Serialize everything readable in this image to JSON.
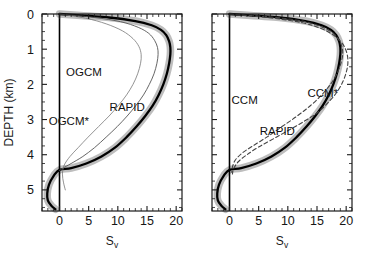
{
  "figure": {
    "background": "#ffffff",
    "panels": [
      {
        "id": "left",
        "xlabel": "S",
        "xlabel_sub": "v",
        "ylabel": "DEPTH (km)",
        "xticks": [
          0,
          5,
          10,
          15,
          20
        ],
        "yticks": [
          0,
          1,
          2,
          3,
          4,
          5
        ],
        "annotations": [
          {
            "text": "OGCM",
            "x": 4.2,
            "y": 1.75
          },
          {
            "text": "OGCM*",
            "x": 1.6,
            "y": 3.15
          },
          {
            "text": "RAPID",
            "x": 11.6,
            "y": 2.75
          }
        ]
      },
      {
        "id": "right",
        "xlabel": "S",
        "xlabel_sub": "v",
        "ylabel": "",
        "xticks": [
          0,
          5,
          10,
          15,
          20
        ],
        "yticks": [
          0,
          1,
          2,
          3,
          4,
          5
        ],
        "annotations": [
          {
            "text": "CCM",
            "x": 2.6,
            "y": 2.55
          },
          {
            "text": "CCM*",
            "x": 16.0,
            "y": 2.35
          },
          {
            "text": "RAPID",
            "x": 8.2,
            "y": 3.45
          }
        ]
      }
    ]
  },
  "chart_data": {
    "type": "line",
    "title": "",
    "xlabel": "Sv",
    "ylabel": "DEPTH (km)",
    "xlim": [
      -3,
      21
    ],
    "ylim": [
      0,
      5.6
    ],
    "y_inverted": true,
    "grid": false,
    "legend": "inline-annotations",
    "xticks": [
      0,
      5,
      10,
      15,
      20
    ],
    "yticks": [
      0,
      1,
      2,
      3,
      4,
      5
    ],
    "minor_tick_step_x": 1,
    "minor_tick_step_y": 0.25,
    "colors": {
      "rapid_line": "#000000",
      "rapid_band": "#b3b3b3",
      "ogcm": "#555555",
      "ccm": "#444444",
      "zero_line": "#000000",
      "frame": "#1a1a1a"
    },
    "panels": [
      {
        "id": "left",
        "series": [
          {
            "name": "RAPID",
            "style": "solid-thick-with-band",
            "band_halfwidth": 0.75,
            "points": [
              [
                0.0,
                0.0
              ],
              [
                8.5,
                0.1
              ],
              [
                13.0,
                0.2
              ],
              [
                15.8,
                0.32
              ],
              [
                17.4,
                0.45
              ],
              [
                18.3,
                0.6
              ],
              [
                18.8,
                0.78
              ],
              [
                19.0,
                0.95
              ],
              [
                19.0,
                1.15
              ],
              [
                18.8,
                1.4
              ],
              [
                18.4,
                1.7
              ],
              [
                17.8,
                2.0
              ],
              [
                17.0,
                2.3
              ],
              [
                16.0,
                2.6
              ],
              [
                14.7,
                2.9
              ],
              [
                13.2,
                3.2
              ],
              [
                11.5,
                3.5
              ],
              [
                9.5,
                3.8
              ],
              [
                7.2,
                4.05
              ],
              [
                4.6,
                4.25
              ],
              [
                2.0,
                4.38
              ],
              [
                0.0,
                4.43
              ],
              [
                -1.0,
                4.6
              ],
              [
                -1.8,
                4.85
              ],
              [
                -2.1,
                5.1
              ],
              [
                -2.0,
                5.3
              ],
              [
                -1.4,
                5.45
              ],
              [
                -0.7,
                5.55
              ]
            ]
          },
          {
            "name": "OGCM",
            "style": "solid-thin",
            "points": [
              [
                0.0,
                0.0
              ],
              [
                6.0,
                0.1
              ],
              [
                10.5,
                0.22
              ],
              [
                13.5,
                0.38
              ],
              [
                15.3,
                0.55
              ],
              [
                16.3,
                0.75
              ],
              [
                16.8,
                0.95
              ],
              [
                16.9,
                1.15
              ],
              [
                16.7,
                1.4
              ],
              [
                16.2,
                1.7
              ],
              [
                15.4,
                2.0
              ],
              [
                14.4,
                2.3
              ],
              [
                13.1,
                2.6
              ],
              [
                11.6,
                2.9
              ],
              [
                9.9,
                3.2
              ],
              [
                8.0,
                3.5
              ],
              [
                6.0,
                3.8
              ],
              [
                4.0,
                4.05
              ],
              [
                2.0,
                4.25
              ],
              [
                0.6,
                4.38
              ],
              [
                0.0,
                4.45
              ]
            ]
          },
          {
            "name": "OGCM*",
            "style": "solid-thin-light",
            "points": [
              [
                0.0,
                0.0
              ],
              [
                4.5,
                0.12
              ],
              [
                8.0,
                0.28
              ],
              [
                10.8,
                0.48
              ],
              [
                12.6,
                0.7
              ],
              [
                13.6,
                0.92
              ],
              [
                14.0,
                1.15
              ],
              [
                13.9,
                1.4
              ],
              [
                13.4,
                1.7
              ],
              [
                12.6,
                2.0
              ],
              [
                11.5,
                2.3
              ],
              [
                10.1,
                2.6
              ],
              [
                8.5,
                2.9
              ],
              [
                6.7,
                3.2
              ],
              [
                4.9,
                3.5
              ],
              [
                3.2,
                3.8
              ],
              [
                1.8,
                4.05
              ],
              [
                0.8,
                4.3
              ],
              [
                0.5,
                4.55
              ],
              [
                0.7,
                4.8
              ],
              [
                1.0,
                5.0
              ]
            ]
          }
        ]
      },
      {
        "id": "right",
        "series": [
          {
            "name": "RAPID",
            "style": "solid-thick-with-band",
            "band_halfwidth": 0.75,
            "points": [
              [
                0.0,
                0.0
              ],
              [
                8.5,
                0.1
              ],
              [
                13.0,
                0.2
              ],
              [
                15.8,
                0.32
              ],
              [
                17.4,
                0.45
              ],
              [
                18.3,
                0.6
              ],
              [
                18.8,
                0.78
              ],
              [
                19.0,
                0.95
              ],
              [
                19.0,
                1.15
              ],
              [
                18.8,
                1.4
              ],
              [
                18.4,
                1.7
              ],
              [
                17.8,
                2.0
              ],
              [
                17.0,
                2.3
              ],
              [
                16.0,
                2.6
              ],
              [
                14.7,
                2.9
              ],
              [
                13.2,
                3.2
              ],
              [
                11.5,
                3.5
              ],
              [
                9.5,
                3.8
              ],
              [
                7.2,
                4.05
              ],
              [
                4.6,
                4.25
              ],
              [
                2.0,
                4.38
              ],
              [
                0.0,
                4.43
              ],
              [
                -1.0,
                4.6
              ],
              [
                -1.8,
                4.85
              ],
              [
                -2.1,
                5.1
              ],
              [
                -2.0,
                5.3
              ],
              [
                -1.4,
                5.45
              ],
              [
                -0.7,
                5.55
              ]
            ]
          },
          {
            "name": "CCM",
            "style": "dashed",
            "points": [
              [
                0.0,
                0.0
              ],
              [
                8.0,
                0.1
              ],
              [
                13.0,
                0.22
              ],
              [
                16.0,
                0.38
              ],
              [
                17.8,
                0.55
              ],
              [
                18.8,
                0.75
              ],
              [
                19.3,
                0.95
              ],
              [
                19.4,
                1.15
              ],
              [
                19.1,
                1.4
              ],
              [
                18.4,
                1.7
              ],
              [
                17.3,
                2.0
              ],
              [
                15.8,
                2.3
              ],
              [
                13.9,
                2.6
              ],
              [
                11.6,
                2.9
              ],
              [
                9.0,
                3.2
              ],
              [
                6.4,
                3.5
              ],
              [
                4.0,
                3.75
              ],
              [
                2.2,
                3.95
              ],
              [
                1.0,
                4.15
              ],
              [
                0.5,
                4.35
              ],
              [
                0.4,
                4.5
              ]
            ]
          },
          {
            "name": "CCM*",
            "style": "dashed",
            "points": [
              [
                0.0,
                0.0
              ],
              [
                7.5,
                0.12
              ],
              [
                12.5,
                0.25
              ],
              [
                15.8,
                0.42
              ],
              [
                18.0,
                0.62
              ],
              [
                19.4,
                0.85
              ],
              [
                20.1,
                1.1
              ],
              [
                20.3,
                1.35
              ],
              [
                20.1,
                1.6
              ],
              [
                19.5,
                1.9
              ],
              [
                18.5,
                2.2
              ],
              [
                17.0,
                2.5
              ],
              [
                15.1,
                2.8
              ],
              [
                12.8,
                3.05
              ],
              [
                10.2,
                3.3
              ],
              [
                7.5,
                3.55
              ],
              [
                5.0,
                3.78
              ],
              [
                3.0,
                4.0
              ],
              [
                1.5,
                4.2
              ],
              [
                0.7,
                4.4
              ],
              [
                0.5,
                4.55
              ]
            ]
          }
        ]
      }
    ]
  }
}
